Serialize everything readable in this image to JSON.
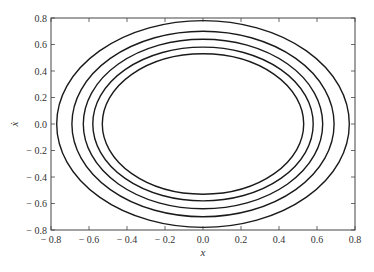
{
  "chart_data": {
    "type": "line",
    "title": "",
    "xlabel": "x",
    "ylabel": "ẋ",
    "xlim": [
      -0.8,
      0.8
    ],
    "ylim": [
      -0.8,
      0.8
    ],
    "grid": false,
    "legend": null,
    "x_ticks": [
      "− 0.8",
      "− 0.6",
      "− 0.4",
      "− 0.2",
      "0.0",
      "0.2",
      "0.4",
      "0.6",
      "0.8"
    ],
    "y_ticks": [
      "0.8",
      "0.6",
      "0.4",
      "0.2",
      "0.0",
      "− 0.2",
      "− 0.4",
      "− 0.6",
      "− 0.8"
    ],
    "series": [
      {
        "name": "orbit-1",
        "shape": "ellipse",
        "center": [
          0.0,
          0.0
        ],
        "semi_axis_x": 0.77,
        "semi_axis_y": 0.78
      },
      {
        "name": "orbit-2",
        "shape": "ellipse",
        "center": [
          0.0,
          0.0
        ],
        "semi_axis_x": 0.69,
        "semi_axis_y": 0.7
      },
      {
        "name": "orbit-3",
        "shape": "ellipse",
        "center": [
          0.0,
          0.0
        ],
        "semi_axis_x": 0.63,
        "semi_axis_y": 0.64
      },
      {
        "name": "orbit-4",
        "shape": "ellipse",
        "center": [
          0.0,
          0.0
        ],
        "semi_axis_x": 0.58,
        "semi_axis_y": 0.58
      },
      {
        "name": "orbit-5",
        "shape": "ellipse",
        "center": [
          0.0,
          0.0
        ],
        "semi_axis_x": 0.53,
        "semi_axis_y": 0.53
      }
    ],
    "line_color": "#1a1a1a"
  }
}
